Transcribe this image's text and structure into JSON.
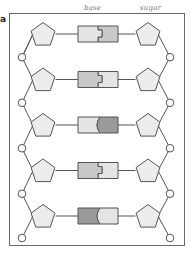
{
  "figure": {
    "panel_label": "a",
    "annotations": {
      "base_label": "base",
      "sugar_label": "sugar"
    },
    "colors": {
      "frame": "#6a6a6a",
      "line": "#555555",
      "pentagon_fill": "#ececec",
      "base_light": "#e4e4e4",
      "base_medium": "#c9c9c9",
      "base_dark": "#9a9a9a",
      "phosphate_fill": "#ffffff"
    },
    "rows": [
      {
        "index": 1,
        "left_shade": "light",
        "right_shade": "medium",
        "joint": "square"
      },
      {
        "index": 2,
        "left_shade": "medium",
        "right_shade": "light",
        "joint": "square"
      },
      {
        "index": 3,
        "left_shade": "light",
        "right_shade": "dark",
        "joint": "round"
      },
      {
        "index": 4,
        "left_shade": "medium",
        "right_shade": "light",
        "joint": "square"
      },
      {
        "index": 5,
        "left_shade": "dark",
        "right_shade": "light",
        "joint": "round"
      }
    ],
    "legend_components": [
      "phosphate",
      "sugar (pentagon)",
      "base pair"
    ]
  }
}
